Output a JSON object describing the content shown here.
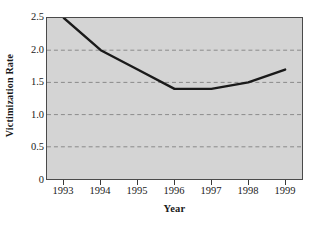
{
  "chart_data": {
    "type": "line",
    "title": "",
    "subtitle": "",
    "xlabel": "Year",
    "ylabel": "Victimization Rate",
    "categories": [
      "1993",
      "1994",
      "1995",
      "1996",
      "1997",
      "1998",
      "1999"
    ],
    "x": [
      1993,
      1994,
      1995,
      1996,
      1997,
      1998,
      1999
    ],
    "values": [
      2.5,
      2.0,
      1.7,
      1.4,
      1.4,
      1.5,
      1.7
    ],
    "series": [
      {
        "name": "Victimization Rate",
        "values": [
          2.5,
          2.0,
          1.7,
          1.4,
          1.4,
          1.5,
          1.7
        ]
      }
    ],
    "ylim": [
      0,
      2.5
    ],
    "xlim": [
      1992.5,
      1999.5
    ],
    "ytick_labels": [
      "0",
      "0.5",
      "1.0",
      "1.5",
      "2.0",
      "2.5"
    ],
    "ytick_values": [
      0,
      0.5,
      1.0,
      1.5,
      2.0,
      2.5
    ],
    "xtick_labels": [
      "1993",
      "1994",
      "1995",
      "1996",
      "1997",
      "1998",
      "1999"
    ],
    "grid": "horizontal-dashed",
    "legend": "none",
    "colors": {
      "plot_background": "#d4d4d4",
      "figure_background": "#ffffff",
      "line": "#1a1a1a",
      "grid": "#8a8a8a",
      "frame": "#4a4a4a",
      "text": "#1a1a1a"
    }
  },
  "axes": {
    "y_title": "Victimization Rate",
    "x_title": "Year",
    "y_ticks": [
      {
        "label": "2.5",
        "value": 2.5
      },
      {
        "label": "2.0",
        "value": 2.0
      },
      {
        "label": "1.5",
        "value": 1.5
      },
      {
        "label": "1.0",
        "value": 1.0
      },
      {
        "label": "0.5",
        "value": 0.5
      },
      {
        "label": "0",
        "value": 0
      }
    ],
    "x_ticks": [
      {
        "label": "1993"
      },
      {
        "label": "1994"
      },
      {
        "label": "1995"
      },
      {
        "label": "1996"
      },
      {
        "label": "1997"
      },
      {
        "label": "1998"
      },
      {
        "label": "1999"
      }
    ]
  }
}
